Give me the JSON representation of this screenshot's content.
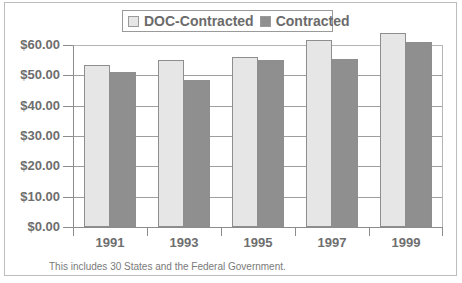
{
  "chart_data": {
    "type": "bar",
    "title": "",
    "xlabel": "",
    "ylabel": "",
    "categories": [
      "1991",
      "1993",
      "1995",
      "1997",
      "1999"
    ],
    "series": [
      {
        "name": "DOC-Contracted",
        "color": "#e6e6e6",
        "values": [
          53.5,
          55.0,
          56.0,
          61.5,
          64.0
        ]
      },
      {
        "name": "Contracted",
        "color": "#8f8f8f",
        "values": [
          51.0,
          48.5,
          55.0,
          55.5,
          61.0
        ]
      }
    ],
    "ylim": [
      0,
      60
    ],
    "yticks": [
      "$0.00",
      "$10.00",
      "$20.00",
      "$30.00",
      "$40.00",
      "$50.00",
      "$60.00"
    ],
    "grid": true,
    "legend_position": "top",
    "annotation": "This includes 30 States and the Federal Government."
  },
  "legend": {
    "items": [
      {
        "label": "DOC-Contracted",
        "color": "#e6e6e6"
      },
      {
        "label": "Contracted",
        "color": "#8f8f8f"
      }
    ]
  },
  "footnote": "This includes 30 States and the Federal Government."
}
